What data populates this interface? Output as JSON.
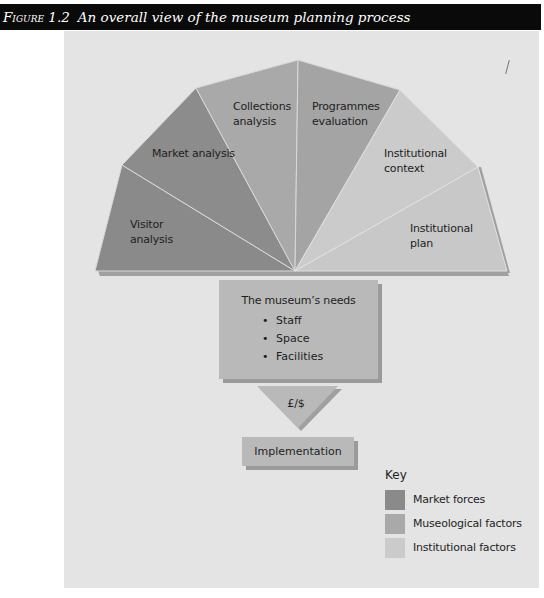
{
  "caption": {
    "figure_number": "Figure 1.2",
    "title": "An overall view of the museum planning process"
  },
  "colors": {
    "market_forces": "#8a8a8a",
    "museological_factors": "#a9a9a9",
    "institutional_factors": "#cbcbcb",
    "panel_background": "#e4e4e4",
    "box_fill": "#b9b9b9",
    "caption_bar": "#0a0a0a"
  },
  "fan_segments": [
    {
      "label_line1": "Visitor",
      "label_line2": "analysis",
      "category": "Market forces"
    },
    {
      "label_line1": "Market analysis",
      "label_line2": "",
      "category": "Market forces"
    },
    {
      "label_line1": "Collections",
      "label_line2": "analysis",
      "category": "Museological factors"
    },
    {
      "label_line1": "Programmes",
      "label_line2": "evaluation",
      "category": "Museological factors"
    },
    {
      "label_line1": "Institutional",
      "label_line2": "context",
      "category": "Institutional factors"
    },
    {
      "label_line1": "Institutional",
      "label_line2": "plan",
      "category": "Institutional factors"
    }
  ],
  "needs": {
    "title": "The museum’s needs",
    "items": [
      "Staff",
      "Space",
      "Facilities"
    ],
    "bullet": "•"
  },
  "funding": {
    "label": "£/$"
  },
  "implementation": {
    "label": "Implementation"
  },
  "key": {
    "title": "Key",
    "items": [
      {
        "label": "Market forces",
        "color": "#8a8a8a"
      },
      {
        "label": "Museological factors",
        "color": "#a9a9a9"
      },
      {
        "label": "Institutional factors",
        "color": "#cbcbcb"
      }
    ]
  }
}
